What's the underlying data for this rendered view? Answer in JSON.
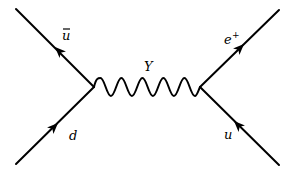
{
  "diagram": {
    "type": "feynman",
    "title": "",
    "colors": {
      "background": "#ffffff",
      "ink": "#000000"
    },
    "vertices": [
      {
        "id": "v_left",
        "x": 94,
        "y": 87
      },
      {
        "id": "v_right",
        "x": 200,
        "y": 87
      }
    ],
    "propagators": [
      {
        "id": "boson",
        "kind": "wavy",
        "from": "v_left",
        "to": "v_right",
        "label": "Y",
        "cycles": 5
      }
    ],
    "external_lines": [
      {
        "id": "ubar",
        "label_base": "u",
        "label_decoration": "bar",
        "end": "top-left",
        "arrow": "away-from-vertex"
      },
      {
        "id": "d",
        "label_base": "d",
        "end": "bottom-left",
        "arrow": "toward-vertex"
      },
      {
        "id": "eplus",
        "label_base": "e",
        "label_sup": "+",
        "end": "top-right",
        "arrow": "away-from-vertex"
      },
      {
        "id": "u",
        "label_base": "u",
        "end": "bottom-right",
        "arrow": "toward-vertex"
      }
    ],
    "labels": {
      "ubar": "u",
      "d": "d",
      "boson": "Y",
      "eplus_base": "e",
      "eplus_sup": "+",
      "u": "u"
    }
  }
}
